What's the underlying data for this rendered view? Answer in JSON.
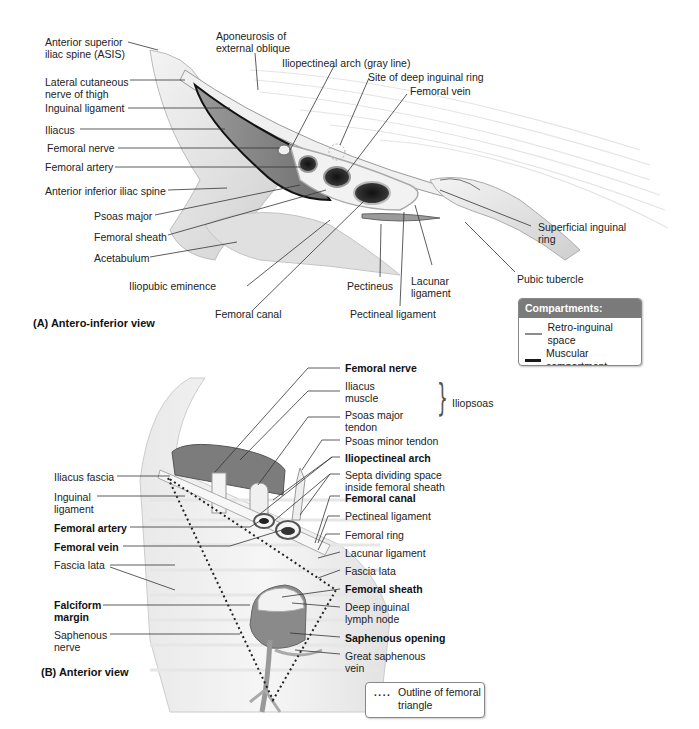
{
  "figure": {
    "panel_a": {
      "caption": "(A) Antero-inferior view",
      "labels": {
        "asis": [
          "Anterior superior",
          "iliac spine (ASIS)"
        ],
        "aponeurosis": [
          "Aponeurosis of",
          "external oblique"
        ],
        "iliopectineal_arch": "Iliopectineal arch (gray line)",
        "deep_ring": "Site of deep inguinal ring",
        "femoral_vein": "Femoral vein",
        "lat_cut_nerve": [
          "Lateral cutaneous",
          "nerve of thigh"
        ],
        "inguinal_ligament": "Inguinal ligament",
        "iliacus": "Iliacus",
        "femoral_nerve": "Femoral nerve",
        "femoral_artery": "Femoral artery",
        "aiis": "Anterior inferior iliac spine",
        "psoas_major": "Psoas major",
        "femoral_sheath": "Femoral sheath",
        "acetabulum": "Acetabulum",
        "iliopubic_eminence": "Iliopubic eminence",
        "femoral_canal": "Femoral canal",
        "pectineus": "Pectineus",
        "lacunar_ligament": [
          "Lacunar",
          "ligament"
        ],
        "pectineal_ligament": "Pectineal ligament",
        "superficial_ring": [
          "Superficial inguinal",
          "ring"
        ],
        "pubic_tubercle": "Pubic tubercle"
      },
      "legend": {
        "title": "Compartments:",
        "items": [
          {
            "label": "Retro-inguinal space",
            "color": "#8c8c8c"
          },
          {
            "label": "Muscular compartment",
            "color": "#1a1a1a"
          },
          {
            "label": "Vascular compartment",
            "color": "#d2d2d2"
          }
        ]
      }
    },
    "panel_b": {
      "caption": "(B) Anterior view",
      "labels_right": {
        "femoral_nerve": "Femoral nerve",
        "iliacus_muscle": [
          "Iliacus",
          "muscle"
        ],
        "psoas_major_tendon": [
          "Psoas major",
          "tendon"
        ],
        "iliopsoas": "Iliopsoas",
        "psoas_minor_tendon": "Psoas minor tendon",
        "iliopectineal_arch": "Iliopectineal arch",
        "septa": [
          "Septa dividing space",
          "inside femoral sheath"
        ],
        "femoral_canal": "Femoral canal",
        "pectineal_ligament": "Pectineal ligament",
        "femoral_ring": "Femoral ring",
        "lacunar_ligament": "Lacunar ligament",
        "fascia_lata": "Fascia lata",
        "femoral_sheath": "Femoral sheath",
        "deep_node": [
          "Deep inguinal",
          "lymph node"
        ],
        "saphenous_opening": "Saphenous opening",
        "great_saphenous": [
          "Great saphenous",
          "vein"
        ]
      },
      "labels_left": {
        "iliacus_fascia": "Iliacus fascia",
        "inguinal_ligament": [
          "Inguinal",
          "ligament"
        ],
        "femoral_artery": "Femoral artery",
        "femoral_vein": "Femoral vein",
        "fascia_lata": "Fascia lata",
        "falciform": [
          "Falciform",
          "margin"
        ],
        "saphenous_nerve": [
          "Saphenous",
          "nerve"
        ]
      },
      "legend": {
        "symbol": "····",
        "label": [
          "Outline of femoral",
          "triangle"
        ]
      }
    }
  }
}
